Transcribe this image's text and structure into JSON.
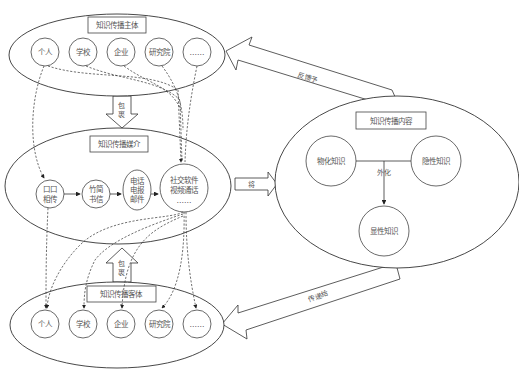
{
  "diagram": {
    "subject": {
      "title": "知识传播主体",
      "nodes": [
        "个人",
        "学校",
        "企业",
        "研究院",
        "……"
      ]
    },
    "medium": {
      "title": "知识传播媒介",
      "nodes": [
        {
          "line1": "口口",
          "line2": "相传",
          "line3": ""
        },
        {
          "line1": "竹简",
          "line2": "书信",
          "line3": ""
        },
        {
          "line1": "电话",
          "line2": "电报",
          "line3": "邮件"
        },
        {
          "line1": "社交软件",
          "line2": "视频通话",
          "line3": "……"
        }
      ]
    },
    "object": {
      "title": "知识传播客体",
      "nodes": [
        "个人",
        "学校",
        "企业",
        "研究院",
        "……"
      ]
    },
    "content": {
      "title": "知识传播内容",
      "nodes": [
        "物化知识",
        "隐性知识",
        "显性知识"
      ],
      "edge_label": "外化"
    },
    "arrows": {
      "subject_to_medium": [
        "包",
        "裹"
      ],
      "object_to_medium": [
        "包",
        "裹"
      ],
      "medium_to_content": "将",
      "content_to_subject": "反馈予",
      "content_to_object": "传递给"
    }
  }
}
